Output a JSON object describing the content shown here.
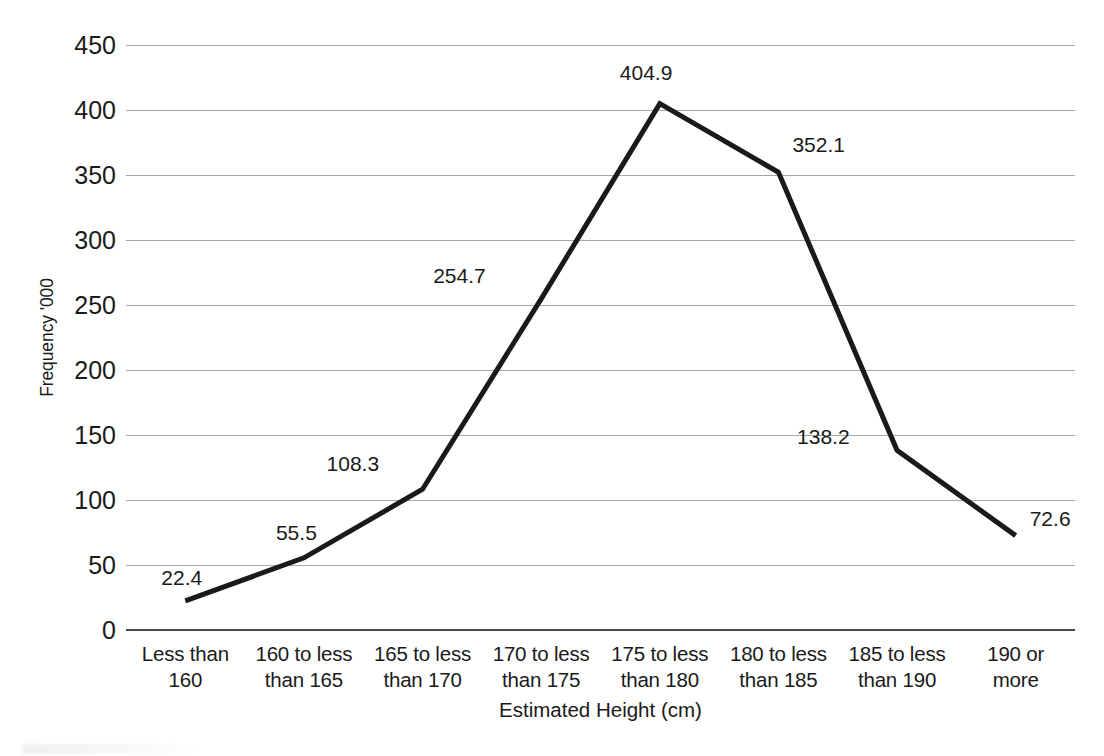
{
  "chart_data": {
    "type": "line",
    "title": "",
    "xlabel": "Estimated Height (cm)",
    "ylabel": "Frequency '000",
    "categories": [
      "Less than 160",
      "160 to less than 165",
      "165 to less than 170",
      "170 to less than 175",
      "175 to less than 180",
      "180 to less than 185",
      "185 to less than 190",
      "190 or more"
    ],
    "category_lines": [
      [
        "Less than",
        "160"
      ],
      [
        "160 to less",
        "than 165"
      ],
      [
        "165 to less",
        "than 170"
      ],
      [
        "170 to less",
        "than 175"
      ],
      [
        "175 to less",
        "than 180"
      ],
      [
        "180 to less",
        "than 185"
      ],
      [
        "185 to less",
        "than 190"
      ],
      [
        "190 or",
        "more"
      ]
    ],
    "values": [
      22.4,
      55.5,
      108.3,
      254.7,
      404.9,
      352.1,
      138.2,
      72.6
    ],
    "point_labels": [
      "22.4",
      "55.5",
      "108.3",
      "254.7",
      "404.9",
      "352.1",
      "138.2",
      "72.6"
    ],
    "ylim": [
      0,
      450
    ],
    "ytick_step": 50,
    "yticks": [
      "0",
      "50",
      "100",
      "150",
      "200",
      "250",
      "300",
      "350",
      "400",
      "450"
    ],
    "grid": true,
    "legend": "none",
    "series_color": "#1a1a1a",
    "gridline_color": "#a6a6a6",
    "axis_color": "#4a4a4a",
    "background_color": "#ffffff",
    "label_offsets": [
      {
        "dx": -24,
        "dy": -34,
        "align": "left"
      },
      {
        "dx": -28,
        "dy": -36,
        "align": "left"
      },
      {
        "dx": -96,
        "dy": -36,
        "align": "left"
      },
      {
        "dx": -108,
        "dy": -34,
        "align": "left"
      },
      {
        "dx": -40,
        "dy": -42,
        "align": "left"
      },
      {
        "dx": 14,
        "dy": -38,
        "align": "left"
      },
      {
        "dx": -100,
        "dy": -24,
        "align": "left"
      },
      {
        "dx": 14,
        "dy": -28,
        "align": "left"
      }
    ]
  }
}
